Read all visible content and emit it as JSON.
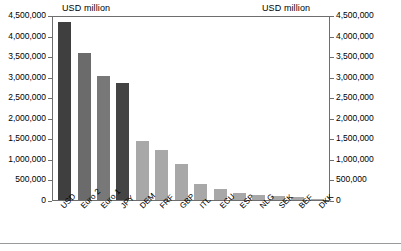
{
  "titles": {
    "left": "USD million",
    "right": "USD million"
  },
  "chart_data": {
    "type": "bar",
    "title": "USD million",
    "xlabel": "",
    "ylabel": "USD million",
    "ylim": [
      0,
      4500000
    ],
    "grid": false,
    "legend": "none",
    "dual_axis": true,
    "right_ylabel": "USD million",
    "right_ylim": [
      0,
      4500000
    ],
    "categories": [
      "USD",
      "Euro 2",
      "Euro 1",
      "JPY",
      "DEM",
      "FRF",
      "GBP",
      "ITL",
      "ECU",
      "ESP",
      "NLG",
      "SEK",
      "BEF",
      "DKK"
    ],
    "values": [
      4380000,
      3610000,
      3050000,
      2880000,
      1450000,
      1230000,
      880000,
      400000,
      270000,
      175000,
      135000,
      110000,
      85000,
      35000
    ],
    "tick_labels": [
      "4,500,000",
      "4,000,000",
      "3,500,000",
      "3,000,000",
      "2,500,000",
      "2,000,000",
      "1,500,000",
      "1,000,000",
      "500,000",
      "0"
    ],
    "tick_values": [
      4500000,
      4000000,
      3500000,
      3000000,
      2500000,
      2000000,
      1500000,
      1000000,
      500000,
      0
    ],
    "bar_colors": [
      "#3f3f3f",
      "#6b6b6b",
      "#787878",
      "#444444",
      "#a8a8a8",
      "#a8a8a8",
      "#a8a8a8",
      "#a8a8a8",
      "#a8a8a8",
      "#a8a8a8",
      "#a8a8a8",
      "#a8a8a8",
      "#a8a8a8",
      "#a8a8a8"
    ]
  }
}
